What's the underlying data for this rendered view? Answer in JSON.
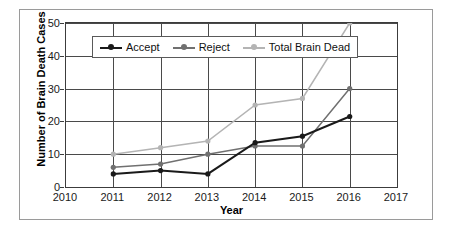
{
  "chart_data": {
    "type": "line",
    "title": "",
    "xlabel": "Year",
    "ylabel": "Number of Brain Death Cases",
    "x": [
      2011,
      2012,
      2013,
      2014,
      2015,
      2016
    ],
    "xlim": [
      2010,
      2017
    ],
    "ylim": [
      0,
      50
    ],
    "xticks": [
      "2010",
      "2011",
      "2012",
      "2013",
      "2014",
      "2015",
      "2016",
      "2017"
    ],
    "yticks": [
      "0",
      "10",
      "20",
      "30",
      "40",
      "50"
    ],
    "grid": "horizontal-and-vertical",
    "legend_position": "top-left-inside",
    "series": [
      {
        "name": "Accept",
        "color": "#1a1a1a",
        "marker": "circle",
        "values": [
          4,
          5,
          4,
          13.5,
          15.5,
          21.5
        ]
      },
      {
        "name": "Reject",
        "color": "#707070",
        "marker": "circle",
        "values": [
          6,
          7,
          10,
          12.5,
          12.5,
          30
        ]
      },
      {
        "name": "Total Brain Dead",
        "color": "#b4b4b4",
        "marker": "circle",
        "values": [
          10,
          12,
          14,
          25,
          27,
          50
        ]
      }
    ]
  }
}
